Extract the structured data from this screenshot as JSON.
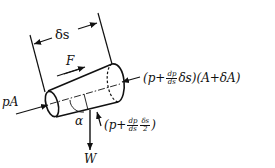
{
  "diagram": {
    "labels": {
      "length": "δs",
      "shear_force": "F",
      "upstream_force": "pA",
      "angle": "α",
      "weight": "W",
      "downstream_force": {
        "open": "(p+",
        "frac_num": "dp",
        "frac_den": "ds",
        "tail": "δs)(A+δA)"
      },
      "side_force": {
        "open": "(p+",
        "frac1_num": "dp",
        "frac1_den": "ds",
        "frac2_num": "δs",
        "frac2_den": "2",
        "close": ")"
      }
    },
    "colors": {
      "stroke": "#111111",
      "background": "#ffffff"
    }
  }
}
